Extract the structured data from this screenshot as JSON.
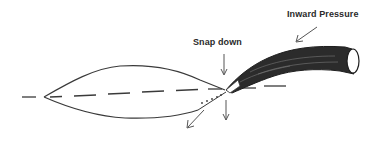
{
  "diagram": {
    "labels": {
      "inward_pressure": "Inward Pressure",
      "snap_down": "Snap down"
    },
    "colors": {
      "stroke": "#3a3a3a",
      "fill_dark": "#2b2b2b",
      "background": "#ffffff"
    },
    "elements": [
      "lens-shaped leaf outline (left)",
      "dashed centerline axis",
      "dark curved stem / petiole (right)",
      "inward pressure arrow",
      "snap down arrow",
      "downward arrows below joint",
      "dotted snapped-down position line"
    ]
  }
}
